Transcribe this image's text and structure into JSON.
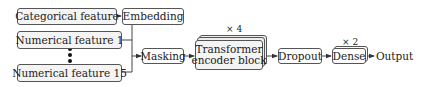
{
  "diagram": {
    "inputs": {
      "categorical": "Categorical feature",
      "numerical_first": "Numerical feature 1",
      "numerical_last": "Numerical feature 15"
    },
    "nodes": {
      "embedding": "Embedding",
      "masking": "Masking",
      "transformer_line1": "Transformer",
      "transformer_line2": "encoder block",
      "dropout": "Dropout",
      "dense": "Dense",
      "output": "Output"
    },
    "multipliers": {
      "transformer": "× 4",
      "dense": "× 2"
    },
    "colors": {
      "box_border": "#555555",
      "box_fill": "#f4f4f4",
      "line": "#444444"
    }
  }
}
